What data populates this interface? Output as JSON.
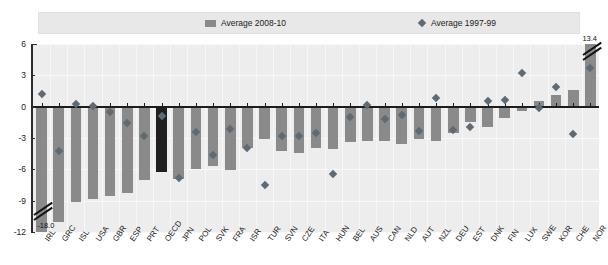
{
  "legend": {
    "bar_label": "Average 2008-10",
    "marker_label": "Average  1997-99",
    "bar_color": "#8a8a8a",
    "marker_color": "#5f6a72"
  },
  "annotations": {
    "left_break_value": "-18.0",
    "right_break_value": "13.4"
  },
  "chart_data": {
    "type": "bar",
    "title": "",
    "subtitle": "",
    "xlabel": "",
    "ylabel": "",
    "ylim": [
      -12,
      6
    ],
    "yticks": [
      6,
      3,
      0,
      -3,
      -6,
      -9,
      -12
    ],
    "ytick_labels": [
      "6",
      "3",
      "0",
      "-3",
      "-6",
      "-9",
      "-12"
    ],
    "grid": true,
    "legend_position": "top",
    "highlight_category": "OECD",
    "highlight_color": "#1f1f1f",
    "categories": [
      "IRL",
      "GRC",
      "ISL",
      "USA",
      "GBR",
      "ESP",
      "PRT",
      "OECD",
      "JPN",
      "POL",
      "SVK",
      "FRA",
      "ISR",
      "TUR",
      "SVN",
      "CZE",
      "ITA",
      "HUN",
      "BEL",
      "AUS",
      "CAN",
      "NLD",
      "AUT",
      "NZL",
      "DEU",
      "EST",
      "DNK",
      "FIN",
      "LUX",
      "SWE",
      "KOR",
      "CHE",
      "NOR"
    ],
    "series": [
      {
        "name": "Average 2008-10",
        "type": "bar",
        "values": [
          -18.0,
          -11.0,
          -9.1,
          -8.8,
          -8.6,
          -8.3,
          -7.0,
          -6.3,
          -6.9,
          -6.0,
          -5.7,
          -6.1,
          -4.0,
          -3.1,
          -4.2,
          -4.4,
          -4.0,
          -4.1,
          -3.4,
          -3.3,
          -3.3,
          -3.6,
          -3.1,
          -3.3,
          -2.5,
          -1.5,
          -1.9,
          -1.1,
          -0.4,
          0.5,
          1.1,
          1.6,
          13.4
        ],
        "broken": [
          {
            "category": "IRL",
            "label": "-18.0"
          },
          {
            "category": "NOR",
            "label": "13.4"
          }
        ]
      },
      {
        "name": "Average  1997-99",
        "type": "scatter",
        "values": [
          1.2,
          -4.2,
          0.3,
          0.1,
          -0.5,
          -1.6,
          -2.8,
          -0.9,
          -6.8,
          -2.4,
          -4.6,
          -2.1,
          -4.0,
          -7.5,
          -2.8,
          -2.8,
          -2.5,
          -6.4,
          -1.0,
          0.2,
          -1.2,
          -0.8,
          -2.3,
          0.8,
          -2.2,
          -1.9,
          0.5,
          0.6,
          3.2,
          -0.1,
          1.9,
          -2.6,
          3.7
        ]
      }
    ]
  }
}
